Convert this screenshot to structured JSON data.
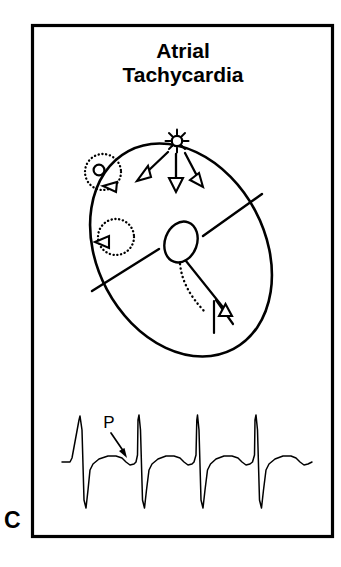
{
  "figure": {
    "panel_letter": "C",
    "title_line1": "Atrial",
    "title_line2": "Tachycardia",
    "stroke_color": "#000000",
    "background_color": "#ffffff"
  },
  "diagram": {
    "name": "heart-schematic",
    "focus_icon": "starburst-focus-icon",
    "av_node_label": "av-node",
    "his_bundle_label": "his-bundle",
    "conduction_arrow_count": 3,
    "reentry_circuit_count": 2
  },
  "ecg": {
    "p_wave_label": "P",
    "beat_count": 4,
    "baseline_y": 462,
    "beat_x_positions": [
      80,
      138.5,
      197,
      255.5
    ]
  },
  "chart_data": {
    "type": "line",
    "title": "Atrial Tachycardia",
    "xlabel": "",
    "ylabel": "",
    "annotations": [
      "P"
    ],
    "series": [
      {
        "name": "ecg-rhythm-strip",
        "points": [
          [
            62,
            462
          ],
          [
            70,
            462
          ],
          [
            72,
            458
          ],
          [
            79,
            420
          ],
          [
            80,
            416
          ],
          [
            82,
            430
          ],
          [
            84,
            500
          ],
          [
            86,
            508
          ],
          [
            88,
            490
          ],
          [
            90,
            470
          ],
          [
            93,
            464
          ],
          [
            99,
            459
          ],
          [
            108,
            456
          ],
          [
            116,
            456
          ],
          [
            122,
            458
          ],
          [
            126,
            462
          ],
          [
            130,
            465
          ],
          [
            134,
            464
          ],
          [
            136,
            462
          ],
          [
            137.5,
            455
          ],
          [
            138,
            420
          ],
          [
            139,
            415
          ],
          [
            140.5,
            430
          ],
          [
            142.5,
            500
          ],
          [
            144.5,
            508
          ],
          [
            146.5,
            490
          ],
          [
            149,
            470
          ],
          [
            152,
            464
          ],
          [
            158,
            459
          ],
          [
            166,
            456
          ],
          [
            174,
            456
          ],
          [
            180,
            458
          ],
          [
            184,
            462
          ],
          [
            188,
            465
          ],
          [
            192,
            464
          ],
          [
            194,
            462
          ],
          [
            196,
            455
          ],
          [
            196.8,
            420
          ],
          [
            197.5,
            415
          ],
          [
            199,
            430
          ],
          [
            201,
            500
          ],
          [
            203,
            508
          ],
          [
            205,
            490
          ],
          [
            207.5,
            470
          ],
          [
            210.5,
            464
          ],
          [
            216,
            459
          ],
          [
            224,
            456
          ],
          [
            232,
            456
          ],
          [
            238,
            458
          ],
          [
            242,
            462
          ],
          [
            246,
            465
          ],
          [
            250,
            464
          ],
          [
            252.5,
            462
          ],
          [
            254.5,
            455
          ],
          [
            255,
            420
          ],
          [
            256,
            415
          ],
          [
            257.5,
            430
          ],
          [
            259.5,
            500
          ],
          [
            261.5,
            508
          ],
          [
            263.5,
            490
          ],
          [
            266,
            470
          ],
          [
            269,
            464
          ],
          [
            275,
            459
          ],
          [
            283,
            456
          ],
          [
            291,
            456
          ],
          [
            296,
            458
          ],
          [
            300,
            462
          ],
          [
            304,
            465
          ],
          [
            308,
            464
          ],
          [
            312,
            462
          ]
        ]
      }
    ]
  }
}
